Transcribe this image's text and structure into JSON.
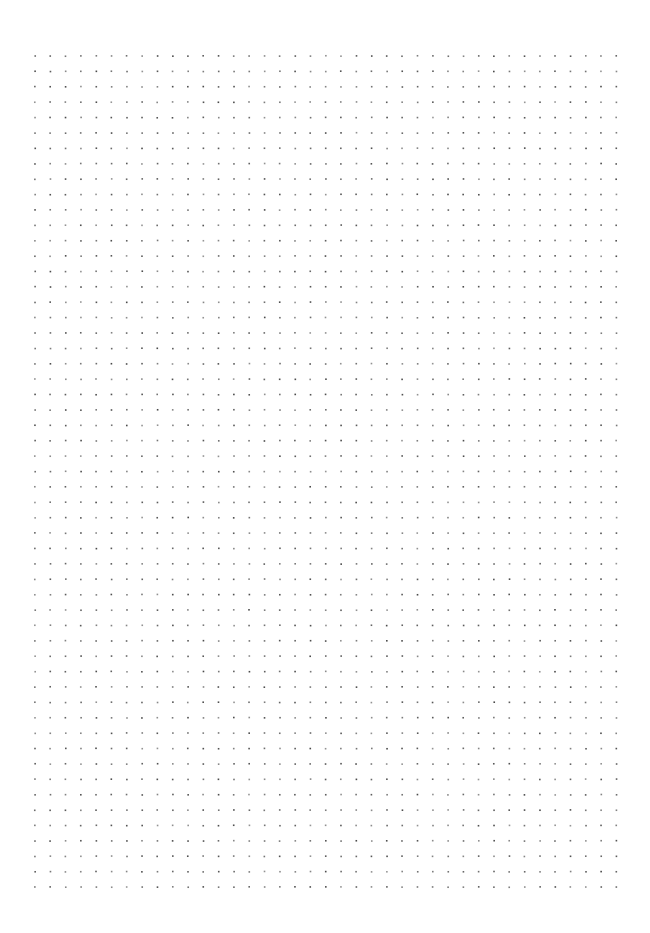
{
  "page": {
    "kind": "dot-grid-paper",
    "width": 650,
    "height": 933,
    "background_color": "#ffffff"
  },
  "dot_grid": {
    "columns": 39,
    "rows": 55,
    "origin_x": 35,
    "origin_y": 56,
    "spacing_x": 15.3,
    "spacing_y": 15.39,
    "dot_size": 1.6,
    "dot_color": "#3f3f3f",
    "dot_opacity_min": 0.55,
    "dot_opacity_max": 0.95,
    "dot_shape": "square"
  }
}
